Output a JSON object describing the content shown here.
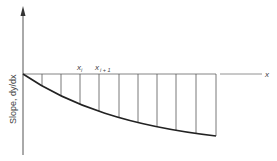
{
  "diagram": {
    "y_axis_label": "Slope, dy/dx",
    "x_axis_label": "x",
    "point_labels": {
      "xi": "x",
      "xi_sub": "i",
      "xi1": "x",
      "xi1_sub": "i + 1"
    },
    "vertical_lines_x": [
      42,
      61,
      80,
      99,
      119,
      138,
      157,
      176,
      196,
      216
    ],
    "colors": {
      "line": "#333333",
      "curve": "#222222",
      "text": "#444444"
    }
  }
}
